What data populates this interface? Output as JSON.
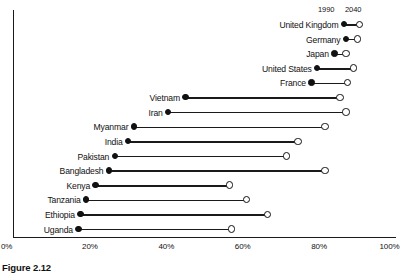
{
  "caption": "Figure 2.12",
  "legend": {
    "series_1_label": "1990",
    "series_2_label": "2040"
  },
  "axis": {
    "ticks": [
      "0%",
      "20%",
      "40%",
      "60%",
      "80%",
      "100%"
    ],
    "tick_values": [
      0,
      20,
      40,
      60,
      80,
      100
    ]
  },
  "chart_data": {
    "type": "scatter",
    "subtype": "dumbbell",
    "title": "",
    "xlabel": "",
    "ylabel": "",
    "xlim": [
      0,
      100
    ],
    "grid": false,
    "legend_position": "top-right",
    "categories": [
      "United Kingdom",
      "Germany",
      "Japan",
      "United States",
      "France",
      "Vietnam",
      "Iran",
      "Myanmar",
      "India",
      "Pakistan",
      "Bangladesh",
      "Kenya",
      "Tanzania",
      "Ethiopia",
      "Uganda"
    ],
    "series": [
      {
        "name": "1990",
        "marker": "filled-circle",
        "values": [
          86.5,
          87,
          84,
          79.5,
          78,
          45,
          40.5,
          31.5,
          30,
          26.5,
          25,
          21.5,
          19,
          17.5,
          17
        ]
      },
      {
        "name": "2040",
        "marker": "open-circle",
        "values": [
          90.5,
          90,
          87,
          89,
          87.5,
          85.5,
          87,
          81.5,
          74.5,
          71.5,
          81.5,
          56.5,
          61,
          66.5,
          57
        ]
      }
    ]
  },
  "colors": {
    "ink": "#111111",
    "background": "#ffffff"
  }
}
